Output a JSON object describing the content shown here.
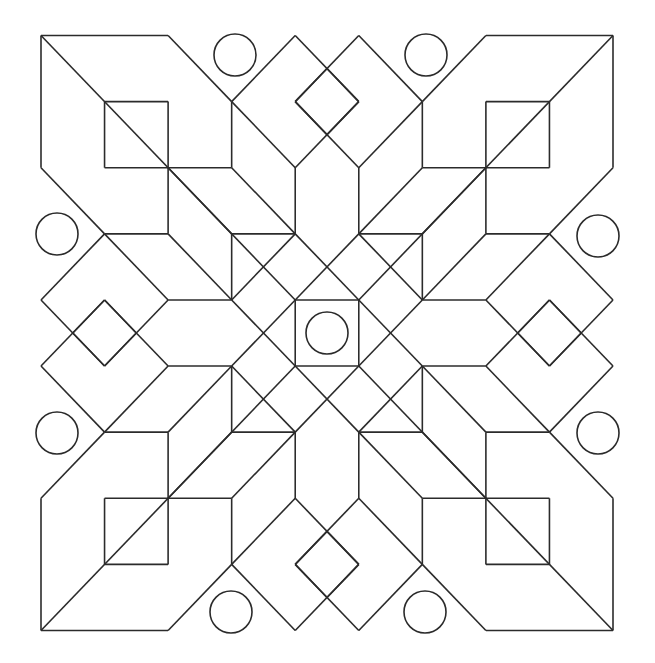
{
  "pattern": {
    "style": "black line art on white",
    "stroke_color": "#2b2b2b",
    "background_color": "#ffffff",
    "symmetry": "8-fold (4 rotations + mirror)",
    "bounds": {
      "left": 40,
      "top": 36,
      "right": 612,
      "bottom": 631
    },
    "center": {
      "x": 327,
      "y": 333
    },
    "center_square": {
      "x": 296,
      "y": 300,
      "w": 63,
      "h": 67
    },
    "center_circle": {
      "cx": 327,
      "cy": 333,
      "r": 21
    },
    "outer_circles": [
      {
        "cx": 235,
        "cy": 55,
        "r": 21
      },
      {
        "cx": 426,
        "cy": 55,
        "r": 21
      },
      {
        "cx": 57,
        "cy": 234,
        "r": 21
      },
      {
        "cx": 598,
        "cy": 236,
        "r": 21
      },
      {
        "cx": 57,
        "cy": 433,
        "r": 21
      },
      {
        "cx": 598,
        "cy": 433,
        "r": 21
      },
      {
        "cx": 231,
        "cy": 612,
        "r": 21
      },
      {
        "cx": 425,
        "cy": 612,
        "r": 21
      }
    ],
    "corner_squares": [
      {
        "x": 104,
        "y": 102,
        "w": 64,
        "h": 66
      },
      {
        "x": 487,
        "y": 102,
        "w": 62,
        "h": 66
      },
      {
        "x": 104,
        "y": 499,
        "w": 64,
        "h": 66
      },
      {
        "x": 487,
        "y": 499,
        "w": 62,
        "h": 66
      }
    ]
  }
}
